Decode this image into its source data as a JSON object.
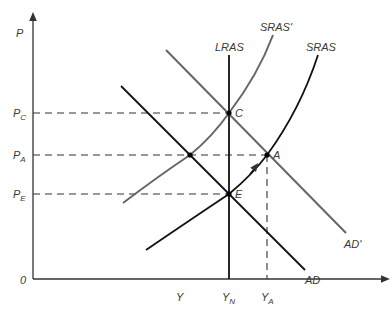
{
  "diagram": {
    "type": "AD-AS model",
    "axes": {
      "y_label": "P",
      "x_label": "Y",
      "origin_label": "0"
    },
    "price_levels": [
      {
        "id": "PC",
        "main": "P",
        "sub": "C"
      },
      {
        "id": "PA",
        "main": "P",
        "sub": "A"
      },
      {
        "id": "PE",
        "main": "P",
        "sub": "E"
      }
    ],
    "output_levels": [
      {
        "id": "YN",
        "main": "Y",
        "sub": "N"
      },
      {
        "id": "YA",
        "main": "Y",
        "sub": "A"
      }
    ],
    "curves": {
      "lras": "LRAS",
      "sras": "SRAS",
      "sras_prime": "SRAS'",
      "ad": "AD",
      "ad_prime": "AD'"
    },
    "points": {
      "c": "C",
      "a": "A",
      "e": "E"
    },
    "colors": {
      "original_curves": "#111111",
      "shifted_curves": "#666666",
      "dashed_guides": "#333333"
    }
  }
}
